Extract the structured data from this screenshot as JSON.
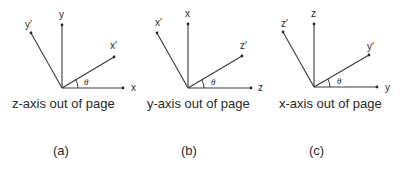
{
  "panels": [
    {
      "id": "a",
      "origin": [
        62,
        88
      ],
      "axes": {
        "horizontal": {
          "label": "x",
          "end": [
            123,
            88
          ],
          "label_pos": [
            131,
            91
          ]
        },
        "vertical": {
          "label": "y",
          "end": [
            62,
            25
          ],
          "label_pos": [
            59,
            18
          ]
        },
        "rotated_horizontal": {
          "label": "x′",
          "end": [
            114,
            57
          ],
          "label_pos": [
            110,
            49
          ]
        },
        "rotated_vertical": {
          "label": "y′",
          "end": [
            31,
            33
          ],
          "label_pos": [
            25,
            28
          ]
        }
      },
      "angle_label": "θ",
      "angle_label_pos": [
        84,
        85
      ],
      "caption": "z-axis out of page",
      "caption_pos": [
        12,
        108
      ],
      "subfigure": "(a)",
      "subfigure_pos": [
        53,
        155
      ]
    },
    {
      "id": "b",
      "origin": [
        188,
        88
      ],
      "axes": {
        "horizontal": {
          "label": "z",
          "end": [
            251,
            88
          ],
          "label_pos": [
            258,
            91
          ]
        },
        "vertical": {
          "label": "x",
          "end": [
            188,
            24
          ],
          "label_pos": [
            185,
            17
          ]
        },
        "rotated_horizontal": {
          "label": "z′",
          "end": [
            242,
            56
          ],
          "label_pos": [
            240,
            49
          ]
        },
        "rotated_vertical": {
          "label": "x′",
          "end": [
            157,
            33
          ],
          "label_pos": [
            155,
            26
          ]
        }
      },
      "angle_label": "θ",
      "angle_label_pos": [
        211,
        85
      ],
      "caption": "y-axis out of page",
      "caption_pos": [
        147,
        108
      ],
      "subfigure": "(b)",
      "subfigure_pos": [
        181,
        155
      ]
    },
    {
      "id": "c",
      "origin": [
        314,
        87
      ],
      "axes": {
        "horizontal": {
          "label": "y",
          "end": [
            377,
            87
          ],
          "label_pos": [
            385,
            91
          ]
        },
        "vertical": {
          "label": "z",
          "end": [
            314,
            24
          ],
          "label_pos": [
            311,
            17
          ]
        },
        "rotated_horizontal": {
          "label": "y′",
          "end": [
            369,
            55
          ],
          "label_pos": [
            367,
            50
          ]
        },
        "rotated_vertical": {
          "label": "z′",
          "end": [
            283,
            32
          ],
          "label_pos": [
            281,
            27
          ]
        }
      },
      "angle_label": "θ",
      "angle_label_pos": [
        337,
        84
      ],
      "caption": "x-axis out of page",
      "caption_pos": [
        279,
        108
      ],
      "subfigure": "(c)",
      "subfigure_pos": [
        309,
        155
      ]
    }
  ]
}
